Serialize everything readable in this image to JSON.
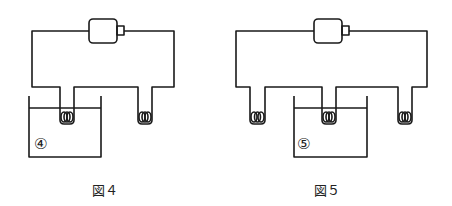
{
  "figures": [
    {
      "caption": "図４",
      "beaker_label": "④"
    },
    {
      "caption": "図５",
      "beaker_label": "⑤"
    }
  ]
}
